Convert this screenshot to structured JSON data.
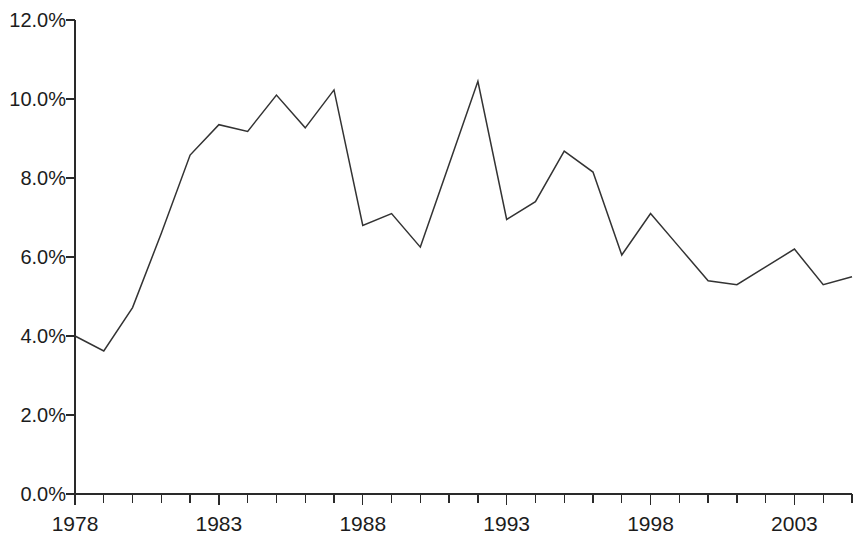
{
  "chart_data": {
    "type": "line",
    "title": "",
    "subtitle": "",
    "xlabel": "",
    "ylabel": "",
    "legend": [],
    "grid": false,
    "xlim": [
      1978,
      2005
    ],
    "ylim": [
      0.0,
      12.0
    ],
    "y_tick_labels": [
      "12.0%",
      "10.0%",
      "8.0%",
      "6.0%",
      "4.0%",
      "2.0%",
      "0.0%"
    ],
    "y_tick_values": [
      12.0,
      10.0,
      8.0,
      6.0,
      4.0,
      2.0,
      0.0
    ],
    "x_tick_labels": [
      "1978",
      "1983",
      "1988",
      "1993",
      "1998",
      "2003"
    ],
    "x_tick_values": [
      1978,
      1983,
      1988,
      1993,
      1998,
      2003
    ],
    "x_minor_ticks": [
      1978,
      1979,
      1980,
      1981,
      1982,
      1983,
      1984,
      1985,
      1986,
      1987,
      1988,
      1989,
      1990,
      1991,
      1992,
      1993,
      1994,
      1995,
      1996,
      1997,
      1998,
      1999,
      2000,
      2001,
      2002,
      2003,
      2004,
      2005
    ],
    "x": [
      1978,
      1979,
      1980,
      1981,
      1982,
      1983,
      1984,
      1985,
      1986,
      1987,
      1988,
      1989,
      1990,
      1991,
      1992,
      1993,
      1994,
      1995,
      1996,
      1997,
      1998,
      1999,
      2000,
      2001,
      2002,
      2003,
      2004,
      2005
    ],
    "values": [
      4.0,
      3.62,
      4.72,
      6.6,
      8.58,
      9.35,
      9.18,
      10.1,
      9.27,
      10.23,
      6.8,
      7.1,
      6.25,
      8.35,
      10.45,
      6.95,
      7.4,
      8.68,
      8.15,
      6.05,
      7.1,
      6.25,
      5.4,
      5.3,
      5.75,
      6.2,
      5.3,
      5.5
    ],
    "series": [
      {
        "name": "series-1",
        "color": "#333333",
        "values": [
          4.0,
          3.62,
          4.72,
          6.6,
          8.58,
          9.35,
          9.18,
          10.1,
          9.27,
          10.23,
          6.8,
          7.1,
          6.25,
          8.35,
          10.45,
          6.95,
          7.4,
          8.68,
          8.15,
          6.05,
          7.1,
          6.25,
          5.4,
          5.3,
          5.75,
          6.2,
          5.3,
          5.5
        ]
      }
    ],
    "colors": {
      "line": "#333333",
      "axis": "#2a2a2a",
      "text": "#1c1c1c",
      "background": "#ffffff"
    }
  },
  "geometry": {
    "plot_left": 75,
    "plot_right": 852,
    "plot_top": 20,
    "plot_bottom": 494
  }
}
